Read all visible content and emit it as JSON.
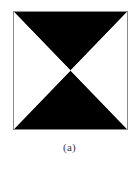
{
  "figure": {
    "caption": "(a)",
    "background_color": "#ffffff",
    "frame": {
      "border_color": "#8a8a8a",
      "fill_color": "#ffffff",
      "x": 13,
      "y": 11,
      "width": 115,
      "height": 119
    },
    "pattern": {
      "name": "hourglass-bowtie-pattern",
      "description": "Square divided by its two diagonals into four triangles; the top and bottom triangles are filled black, the left and right triangles are white.",
      "foreground_color": "#000000",
      "background_color": "#ffffff",
      "top_triangle_points": "0,0 115,0 57.5,59.5",
      "bottom_triangle_points": "0,119 115,119 57.5,59.5",
      "left_triangle_points": "0,0 0,119 57.5,59.5",
      "right_triangle_points": "115,0 115,119 57.5,59.5",
      "center_x": 57.5,
      "center_y": 59.5
    }
  }
}
